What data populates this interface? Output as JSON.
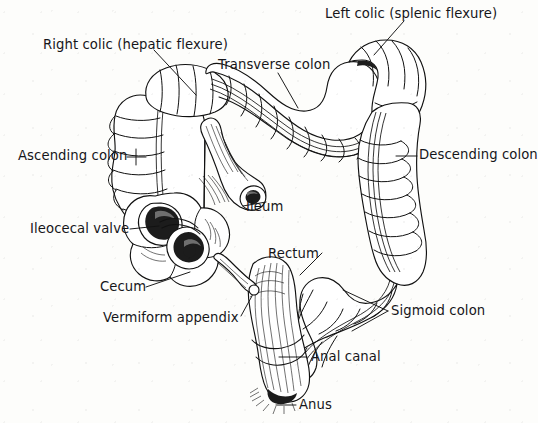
{
  "figure": {
    "background_color": "#fdfdfb",
    "ink_color": "#16161a",
    "style": "black-and-white line drawing"
  },
  "labels": [
    {
      "id": "left-colic",
      "text": "Left colic (splenic flexure)",
      "x": 325,
      "y": 7,
      "align": "left"
    },
    {
      "id": "right-colic",
      "text": "Right colic (hepatic flexure)",
      "x": 43,
      "y": 38,
      "align": "left"
    },
    {
      "id": "transverse-colon",
      "text": "Transverse colon",
      "x": 218,
      "y": 58,
      "align": "left"
    },
    {
      "id": "ascending-colon",
      "text": "Ascending colon",
      "x": 18,
      "y": 149,
      "align": "left"
    },
    {
      "id": "descending-colon",
      "text": "Descending colon",
      "x": 419,
      "y": 148,
      "align": "left"
    },
    {
      "id": "ileum",
      "text": "Ileum",
      "x": 246,
      "y": 200,
      "align": "left"
    },
    {
      "id": "ileocecal-valve",
      "text": "Ileocecal valve",
      "x": 30,
      "y": 222,
      "align": "left"
    },
    {
      "id": "rectum",
      "text": "Rectum",
      "x": 268,
      "y": 247,
      "align": "left"
    },
    {
      "id": "cecum",
      "text": "Cecum",
      "x": 100,
      "y": 280,
      "align": "left"
    },
    {
      "id": "sigmoid-colon",
      "text": "Sigmoid colon",
      "x": 391,
      "y": 304,
      "align": "left"
    },
    {
      "id": "vermiform-appendix",
      "text": "Vermiform appendix",
      "x": 103,
      "y": 311,
      "align": "left"
    },
    {
      "id": "anal-canal",
      "text": "Anal canal",
      "x": 311,
      "y": 350,
      "align": "left"
    },
    {
      "id": "anus",
      "text": "Anus",
      "x": 299,
      "y": 398,
      "align": "left"
    }
  ],
  "structures": [
    {
      "id": "ascending-colon",
      "name": "Ascending colon",
      "side": "right-of-body (image left)"
    },
    {
      "id": "transverse-colon",
      "name": "Transverse colon",
      "side": "superior"
    },
    {
      "id": "descending-colon",
      "name": "Descending colon",
      "side": "left-of-body (image right)"
    },
    {
      "id": "sigmoid-colon",
      "name": "Sigmoid colon",
      "side": "inferior-left"
    },
    {
      "id": "rectum",
      "name": "Rectum",
      "side": "midline-inferior"
    },
    {
      "id": "anal-canal",
      "name": "Anal canal",
      "side": "terminal"
    },
    {
      "id": "anus",
      "name": "Anus",
      "side": "terminal opening"
    },
    {
      "id": "cecum",
      "name": "Cecum",
      "side": "inferior-right"
    },
    {
      "id": "vermiform-appendix",
      "name": "Vermiform appendix",
      "side": "off cecum"
    },
    {
      "id": "ileum",
      "name": "Ileum",
      "side": "small-intestine junction"
    },
    {
      "id": "ileocecal-valve",
      "name": "Ileocecal valve",
      "side": "cecum interior"
    },
    {
      "id": "right-colic",
      "name": "Right colic (hepatic flexure)",
      "side": "upper-right bend"
    },
    {
      "id": "left-colic",
      "name": "Left colic (splenic flexure)",
      "side": "upper-left bend"
    }
  ]
}
